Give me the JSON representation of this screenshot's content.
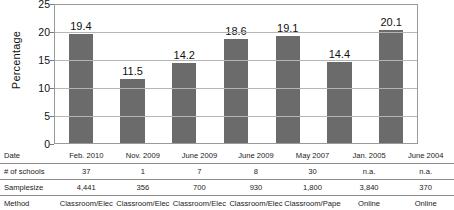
{
  "chart_data": {
    "type": "bar",
    "title": "",
    "xlabel": "",
    "ylabel": "Percentage",
    "categories": [
      "Feb. 2010",
      "Nov. 2009",
      "June 2009",
      "June 2009",
      "May 2007",
      "Jan. 2005",
      "June 2004"
    ],
    "values": [
      19.4,
      11.5,
      14.2,
      18.6,
      19.1,
      14.4,
      20.1
    ],
    "value_labels": [
      "19.4",
      "11.5",
      "14.2",
      "18.6",
      "19.1",
      "14.4",
      "20.1"
    ],
    "ylim": [
      0,
      25
    ],
    "yticks": [
      25,
      20,
      15,
      10,
      5,
      0
    ],
    "ytick_labels": [
      "25",
      "20",
      "15",
      "10",
      "5",
      "0"
    ],
    "grid": true,
    "legend": "none",
    "bar_color": "#6b6b6b",
    "plot_border_color": "#9a9a9a",
    "gridline_color": "#b5b5b5"
  },
  "table": {
    "rows": [
      {
        "label": "Date",
        "cells": [
          "Feb. 2010",
          "Nov. 2009",
          "June 2009",
          "June 2009",
          "May 2007",
          "Jan. 2005",
          "June 2004"
        ]
      },
      {
        "label": "# of schools",
        "cells": [
          "37",
          "1",
          "7",
          "8",
          "30",
          "n.a.",
          "n.a."
        ]
      },
      {
        "label": "Samplesize",
        "cells": [
          "4,441",
          "356",
          "700",
          "930",
          "1,800",
          "3,840",
          "370"
        ]
      },
      {
        "label": "Method",
        "cells": [
          "Classroom/Elec",
          "Classroom/Elec",
          "Classroom/Elec",
          "Classroom/Elec",
          "Classroom/Paper",
          "Online",
          "Online"
        ]
      }
    ]
  }
}
